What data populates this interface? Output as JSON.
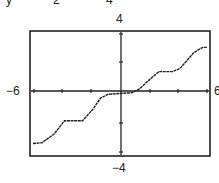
{
  "header_fragment": {
    "texts": [
      "y",
      "2",
      "4"
    ]
  },
  "labels": {
    "ymax": "4",
    "ymin": "−4",
    "xmin": "−6",
    "xmax": "6"
  },
  "colors": {
    "frame": "#222222",
    "curve": "#222222",
    "background": "#ffffff"
  },
  "chart_data": {
    "type": "line",
    "title": "",
    "xlabel": "",
    "ylabel": "",
    "xlim": [
      -6,
      6
    ],
    "ylim": [
      -4,
      4
    ],
    "xticks_step": 2,
    "yticks_step": 2,
    "grid": false,
    "legend": null,
    "series": [
      {
        "name": "f(x)",
        "x": [
          -5.8,
          -5.2,
          -4.4,
          -3.7,
          -3.2,
          -2.5,
          -1.8,
          -1.3,
          -0.8,
          0.0,
          0.8,
          1.3,
          2.1,
          2.6,
          3.5,
          4.0,
          4.9,
          5.5,
          5.8
        ],
        "y": [
          -3.2,
          -3.15,
          -2.6,
          -1.75,
          -1.75,
          -1.75,
          -1.0,
          -0.3,
          -0.05,
          0.0,
          0.05,
          0.3,
          1.0,
          1.4,
          1.4,
          1.6,
          2.6,
          2.95,
          2.95
        ]
      }
    ]
  }
}
